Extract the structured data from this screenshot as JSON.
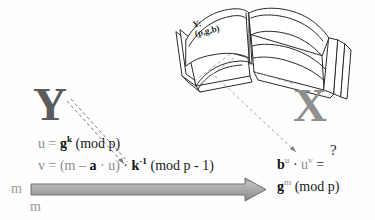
{
  "diagram": {
    "parties": {
      "signer_label": "Y",
      "verifier_label": "X"
    },
    "public_directory": {
      "icon": "open-book-icon",
      "line1": "Y:",
      "line2": "(p,g,b)"
    },
    "signing": {
      "formula_u": {
        "lhs": "u",
        "eq": "=",
        "base": "g",
        "exponent": "k",
        "modulus": "(mod p)"
      },
      "formula_v": {
        "lhs": "v",
        "eq": "=",
        "open": "(",
        "m": "m",
        "minus": "–",
        "a": "a",
        "dot1": "·",
        "u": "u",
        "close": ")",
        "dot2": "·",
        "k": "k",
        "k_exponent": "-1",
        "modulus": "(mod p - 1)"
      }
    },
    "verification": {
      "question_mark": "?",
      "line1": {
        "b": "b",
        "b_exp": "u",
        "dot": "·",
        "u": "u",
        "u_exp": "v",
        "eq": "="
      },
      "line2": {
        "g": "g",
        "g_exp": "m",
        "modulus": "(mod p)"
      }
    },
    "message_channel": {
      "label_left": "m",
      "label_bottom": "m",
      "arrow": "right-block-arrow",
      "arrow_color": "#a9a9a9"
    },
    "colors": {
      "signer": "#5b5b5b",
      "verifier": "#8f8f8f",
      "secret_emphasis": "#111111",
      "public_gray": "#8c8c8c",
      "line": "#2b2b2b",
      "dashed": "#9b9b9b",
      "background": "#fefefe"
    }
  }
}
